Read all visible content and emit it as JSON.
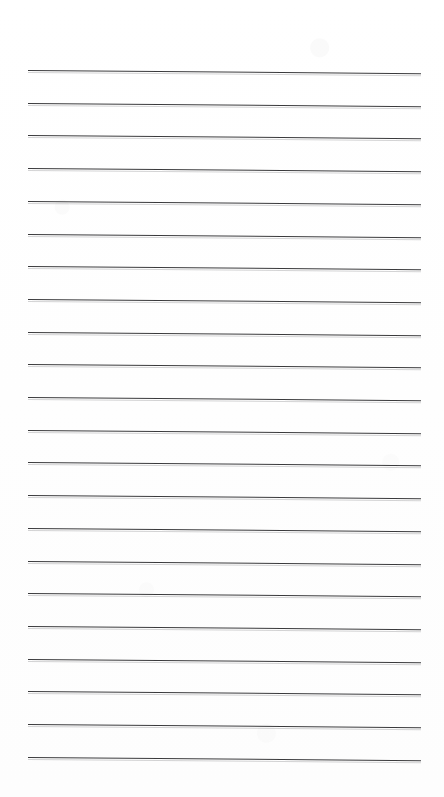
{
  "document": {
    "kind": "scanned-ruled-notepad-page",
    "title": "Blank ruled notepad page",
    "page_width": 444,
    "page_height": 797,
    "background_color": "#fefefe",
    "written_content": "",
    "text_lines": []
  },
  "ruling": {
    "line_count": 22,
    "line_color": "#3a3a3c",
    "line_thickness_px": 1.5,
    "left_margin_px": 28,
    "right_margin_px": 23,
    "line_start_x": 28,
    "line_end_x": 421,
    "line_length_px": 393,
    "first_line_y": 70,
    "last_line_y": 757,
    "line_spacing_px": 32.7,
    "top_margin_px": 70,
    "bottom_margin_px": 40,
    "skew_drop_px": 3.2,
    "skew_note": "lines slope slightly downward left-to-right from scan skew",
    "lines": [
      {
        "index": 1,
        "y_left": 70.0,
        "y_right": 73.2
      },
      {
        "index": 2,
        "y_left": 102.7,
        "y_right": 105.9
      },
      {
        "index": 3,
        "y_left": 135.4,
        "y_right": 138.6
      },
      {
        "index": 4,
        "y_left": 168.1,
        "y_right": 171.3
      },
      {
        "index": 5,
        "y_left": 200.8,
        "y_right": 204.0
      },
      {
        "index": 6,
        "y_left": 233.5,
        "y_right": 236.7
      },
      {
        "index": 7,
        "y_left": 266.2,
        "y_right": 269.4
      },
      {
        "index": 8,
        "y_left": 298.9,
        "y_right": 302.1
      },
      {
        "index": 9,
        "y_left": 331.6,
        "y_right": 334.8
      },
      {
        "index": 10,
        "y_left": 364.3,
        "y_right": 367.5
      },
      {
        "index": 11,
        "y_left": 397.0,
        "y_right": 400.2
      },
      {
        "index": 12,
        "y_left": 429.7,
        "y_right": 432.9
      },
      {
        "index": 13,
        "y_left": 462.4,
        "y_right": 465.6
      },
      {
        "index": 14,
        "y_left": 495.1,
        "y_right": 498.3
      },
      {
        "index": 15,
        "y_left": 527.8,
        "y_right": 531.0
      },
      {
        "index": 16,
        "y_left": 560.5,
        "y_right": 563.7
      },
      {
        "index": 17,
        "y_left": 593.2,
        "y_right": 596.4
      },
      {
        "index": 18,
        "y_left": 625.9,
        "y_right": 629.1
      },
      {
        "index": 19,
        "y_left": 658.6,
        "y_right": 661.8
      },
      {
        "index": 20,
        "y_left": 691.3,
        "y_right": 694.5
      },
      {
        "index": 21,
        "y_left": 724.0,
        "y_right": 727.2
      },
      {
        "index": 22,
        "y_left": 756.7,
        "y_right": 759.9
      }
    ]
  }
}
